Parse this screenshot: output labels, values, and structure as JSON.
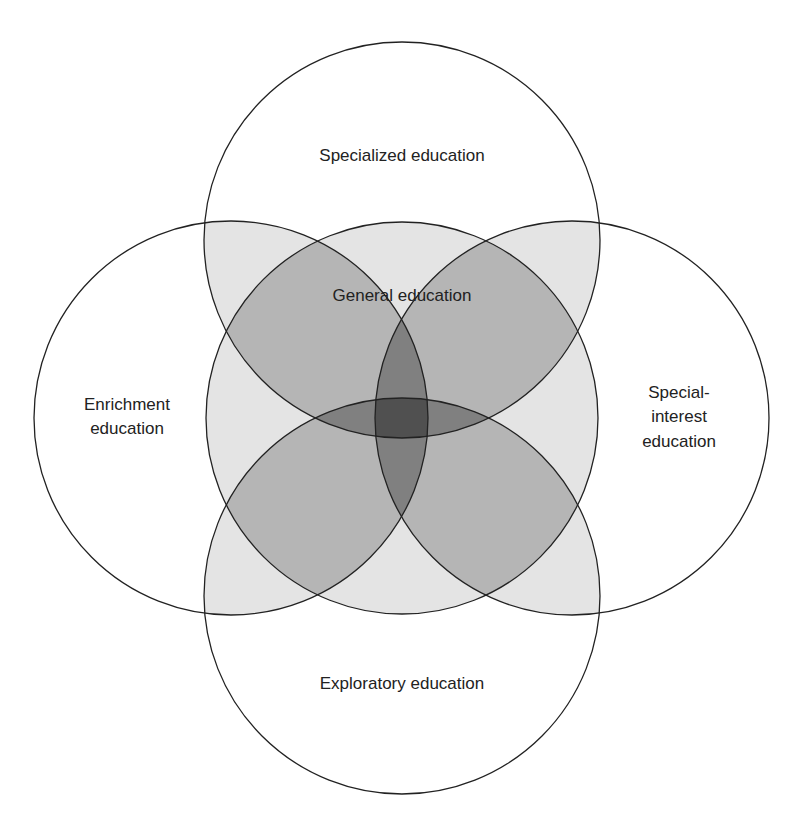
{
  "diagram": {
    "type": "venn",
    "circles": [
      {
        "id": "top",
        "label": [
          "Specialized education"
        ],
        "cx": 402,
        "cy": 240,
        "r": 198
      },
      {
        "id": "left",
        "label": [
          "Enrichment",
          "education"
        ],
        "cx": 231,
        "cy": 418,
        "r": 197
      },
      {
        "id": "right",
        "label": [
          "Special-",
          "interest",
          "education"
        ],
        "cx": 572,
        "cy": 418,
        "r": 197
      },
      {
        "id": "bottom",
        "label": [
          "Exploratory education"
        ],
        "cx": 402,
        "cy": 596,
        "r": 198
      },
      {
        "id": "center",
        "label": [
          "General education"
        ],
        "cx": 402,
        "cy": 418,
        "r": 196
      }
    ],
    "labels": {
      "top": "Specialized education",
      "left_1": "Enrichment",
      "left_2": "education",
      "right_1": "Special-",
      "right_2": "interest",
      "right_3": "education",
      "bottom": "Exploratory education",
      "center": "General education"
    },
    "colors": {
      "stroke": "#222222",
      "overlap_fill": "#000000",
      "background": "#ffffff"
    }
  }
}
